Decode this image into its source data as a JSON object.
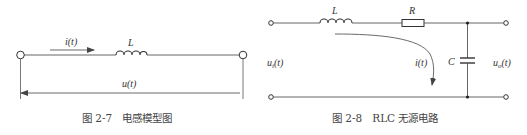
{
  "figures": [
    {
      "id": "fig-2-7",
      "caption": "图 2-7　电感模型图",
      "labels": {
        "current": "i(t)",
        "inductor": "L",
        "voltage": "u(t)"
      }
    },
    {
      "id": "fig-2-8",
      "caption": "图 2-8　RLC 无源电路",
      "labels": {
        "inductor": "L",
        "resistor": "R",
        "capacitor": "C",
        "current": "i(t)",
        "input_voltage": "u_i(t)",
        "input_voltage_main": "u",
        "input_voltage_sub": "i",
        "input_voltage_arg": "(t)",
        "output_voltage": "u_o(t)",
        "output_voltage_main": "u",
        "output_voltage_sub": "o",
        "output_voltage_arg": "(t)"
      }
    }
  ],
  "colors": {
    "stroke": "#555555",
    "text": "#333333"
  }
}
